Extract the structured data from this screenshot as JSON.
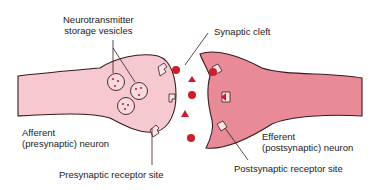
{
  "diagram": {
    "labels": {
      "vesicles": "Neurotransmitter\nstorage vesicles",
      "cleft": "Synaptic cleft",
      "afferent": "Afferent\n(presynaptic) neuron",
      "efferent": "Efferent\n(postsynaptic) neuron",
      "pre_receptor": "Presynaptic receptor site",
      "post_receptor": "Postsynaptic receptor site"
    },
    "colors": {
      "presynaptic_fill": "#f6c9d0",
      "postsynaptic_fill": "#e98a98",
      "outline": "#3a1a1e",
      "neurotransmitter": "#cc1f2a",
      "receptor_fill": "#fbe3e6",
      "text": "#1a1a1a"
    }
  }
}
